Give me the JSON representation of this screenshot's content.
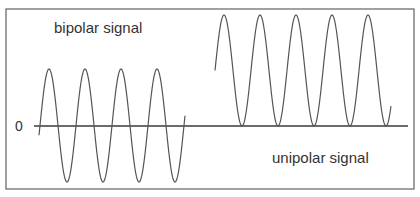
{
  "diagram": {
    "title": "",
    "labels": {
      "bipolar": "bipolar signal",
      "unipolar": "unipolar signal",
      "zero": "0"
    },
    "colors": {
      "frame": "#6e6e6e",
      "axis": "#3a3a3a",
      "wave": "#555555",
      "text": "#333333"
    },
    "frame": {
      "x1": 6,
      "y1": 9,
      "x2": 414,
      "y2": 189
    },
    "zero_axis": {
      "y": 126,
      "x_start": 34,
      "x_end": 408
    },
    "signals": [
      {
        "name": "bipolar signal",
        "x_start": 39,
        "x_end": 185,
        "period_px": 36,
        "first_peak_x": 49,
        "peak_y": 69,
        "trough_y": 182,
        "center_y": 126,
        "peaks": 4,
        "troughs": 4
      },
      {
        "name": "unipolar signal",
        "x_start": 215,
        "x_end": 391,
        "period_px": 36,
        "first_peak_x": 224,
        "peak_y": 15,
        "trough_y": 126,
        "center_y": 70,
        "peaks": 5,
        "troughs": 5
      }
    ]
  }
}
